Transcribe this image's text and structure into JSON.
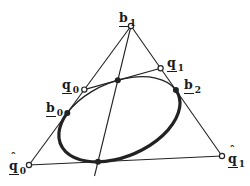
{
  "figure": {
    "name": "conic-with-control-polygon-and-complementary-segment",
    "background_color": "#ffffff",
    "ink_color": "#222222",
    "canvas": {
      "width": 250,
      "height": 186
    },
    "marker_style": {
      "open_radius": 2.6,
      "filled_radius": 3,
      "stroke_width": 1.2
    },
    "points": [
      {
        "id": "b1",
        "x": 131,
        "y": 26,
        "marker": "open",
        "label": {
          "base": "b",
          "sub": "1",
          "hat": false,
          "underline": true
        },
        "label_pos": {
          "x": 119,
          "y": 9
        }
      },
      {
        "id": "q0",
        "x": 84.3,
        "y": 89.6,
        "marker": "open",
        "label": {
          "base": "q",
          "sub": "0",
          "hat": false,
          "underline": true
        },
        "label_pos": {
          "x": 62,
          "y": 76
        }
      },
      {
        "id": "q1",
        "x": 160.6,
        "y": 68.2,
        "marker": "open",
        "label": {
          "base": "q",
          "sub": "1",
          "hat": false,
          "underline": true
        },
        "label_pos": {
          "x": 167,
          "y": 54
        }
      },
      {
        "id": "b0",
        "x": 67.3,
        "y": 112.9,
        "marker": "filled",
        "label": {
          "base": "b",
          "sub": "0",
          "hat": false,
          "underline": true
        },
        "label_pos": {
          "x": 46,
          "y": 99
        }
      },
      {
        "id": "b2",
        "x": 175.9,
        "y": 90.1,
        "marker": "filled",
        "label": {
          "base": "b",
          "sub": "2",
          "hat": false,
          "underline": true
        },
        "label_pos": {
          "x": 184,
          "y": 76
        }
      },
      {
        "id": "qhat0",
        "x": 29,
        "y": 165,
        "marker": "open",
        "label": {
          "base": "q",
          "sub": "0",
          "hat": true,
          "underline": true
        },
        "label_pos": {
          "x": 9,
          "y": 157
        }
      },
      {
        "id": "qhat1",
        "x": 222,
        "y": 156,
        "marker": "open",
        "label": {
          "base": "q",
          "sub": "1",
          "hat": true,
          "underline": true
        },
        "label_pos": {
          "x": 228,
          "y": 150
        }
      },
      {
        "id": "shoulder-point",
        "x": 117.8,
        "y": 80.2,
        "marker": "filled",
        "label": null
      },
      {
        "id": "base-tangent-point",
        "x": 98,
        "y": 161.8,
        "marker": "filled",
        "label": null
      }
    ],
    "lines": [
      {
        "name": "left-side",
        "from": "qhat0",
        "to": "b1",
        "width": 1.1
      },
      {
        "name": "right-side",
        "from": "b1",
        "to": "qhat1",
        "width": 1.1
      },
      {
        "name": "base-line",
        "from": "qhat0",
        "to": "qhat1",
        "width": 1.1
      },
      {
        "name": "median-line",
        "from": "b1",
        "to": [
          94.5,
          176
        ],
        "width": 1.1
      },
      {
        "name": "shoulder-tangent",
        "from": "q0",
        "to": "q1",
        "width": 1.1
      }
    ],
    "ellipse": {
      "cx": 119.4,
      "cy": 119.2,
      "rx": 63.9,
      "ry": 37.4,
      "rotation_deg": -23.1,
      "arcs": [
        {
          "name": "thin-arc",
          "from": "b0",
          "to": "b2",
          "large_arc": 0,
          "sweep": 1,
          "width": 1.4
        },
        {
          "name": "thick-arc",
          "from": "b2",
          "to": "b0",
          "large_arc": 1,
          "sweep": 1,
          "width": 3.2
        }
      ]
    }
  }
}
